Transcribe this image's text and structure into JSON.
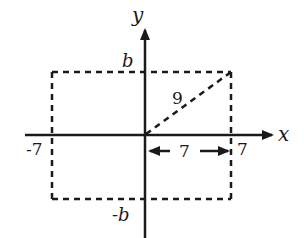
{
  "diagram": {
    "type": "coordinate-plane",
    "axes": {
      "x_label": "x",
      "y_label": "y"
    },
    "rectangle": {
      "style": "dashed",
      "x_range": [
        -7,
        7
      ],
      "y_range": [
        "-b",
        "b"
      ]
    },
    "labels": {
      "top": "b",
      "bottom": "-b",
      "left": "-7",
      "right": "7",
      "diagonal": "9",
      "half_width": "7"
    },
    "diagonal": {
      "from": "origin",
      "to": "top-right corner",
      "length_label": "9",
      "style": "dashed"
    },
    "dimension_arrow": {
      "from": "origin",
      "to": "x=7",
      "label": "7",
      "style": "double-headed"
    },
    "colors": {
      "ink": "#1a1a1a",
      "background": "#ffffff"
    }
  }
}
